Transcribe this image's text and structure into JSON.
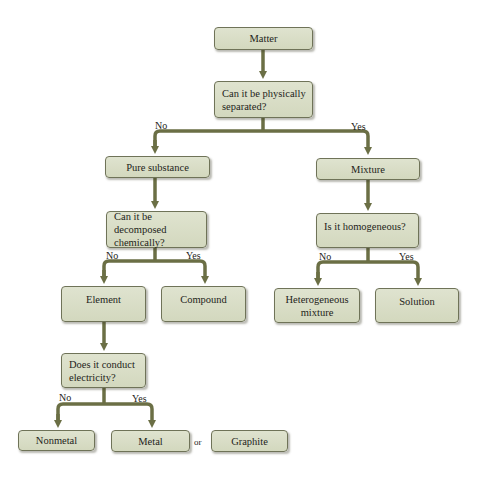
{
  "diagram": {
    "colors": {
      "box_fill": "#d8dcc4",
      "box_border": "#6f7358",
      "arrow": "#6b6f45",
      "text": "#1e1e1a",
      "background": "#ffffff"
    },
    "nodes": {
      "matter": "Matter",
      "q_separated": "Can it be physically separated?",
      "pure_substance": "Pure substance",
      "mixture": "Mixture",
      "q_decomposed": "Can it be decomposed chemically?",
      "q_homogeneous": "Is it homogeneous?",
      "element": "Element",
      "compound": "Compound",
      "heterogeneous_mixture": "Heterogeneous mixture",
      "solution": "Solution",
      "q_conduct": "Does it conduct electricity?",
      "nonmetal": "Nonmetal",
      "metal": "Metal",
      "graphite": "Graphite"
    },
    "edge_labels": {
      "separated_no": "No",
      "separated_yes": "Yes",
      "decomposed_no": "No",
      "decomposed_yes": "Yes",
      "homogeneous_no": "No",
      "homogeneous_yes": "Yes",
      "conduct_no": "No",
      "conduct_yes": "Yes"
    },
    "connector_or": "or",
    "edges": [
      {
        "from": "matter",
        "to": "q_separated"
      },
      {
        "from": "q_separated",
        "to": "pure_substance",
        "label": "No"
      },
      {
        "from": "q_separated",
        "to": "mixture",
        "label": "Yes"
      },
      {
        "from": "pure_substance",
        "to": "q_decomposed"
      },
      {
        "from": "mixture",
        "to": "q_homogeneous"
      },
      {
        "from": "q_decomposed",
        "to": "element",
        "label": "No"
      },
      {
        "from": "q_decomposed",
        "to": "compound",
        "label": "Yes"
      },
      {
        "from": "q_homogeneous",
        "to": "heterogeneous_mixture",
        "label": "No"
      },
      {
        "from": "q_homogeneous",
        "to": "solution",
        "label": "Yes"
      },
      {
        "from": "element",
        "to": "q_conduct"
      },
      {
        "from": "q_conduct",
        "to": "nonmetal",
        "label": "No"
      },
      {
        "from": "q_conduct",
        "to": "metal",
        "label": "Yes"
      }
    ]
  }
}
